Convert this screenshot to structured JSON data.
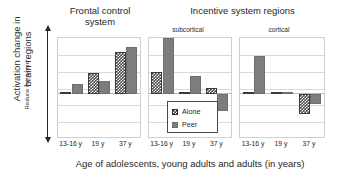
{
  "figure": {
    "y_axis_label_line1": "Activation change in",
    "y_axis_label_line2": "brain regions",
    "y_axis_direction_label": "Reduce increased",
    "x_axis_title": "Age of adolescents, young adults and adults (in years)"
  },
  "panels": [
    {
      "id": "frontal",
      "title": "Frontal control\nsystem",
      "subtitle": ""
    },
    {
      "id": "subcortical",
      "title": "Incentive system regions",
      "subtitle": "subcortical"
    },
    {
      "id": "cortical",
      "title": "",
      "subtitle": "cortical"
    }
  ],
  "legend": {
    "items": [
      {
        "label": "Alone",
        "swatch": "checkered-swatch",
        "color": "#3f3f3f"
      },
      {
        "label": "Peer",
        "swatch": "solid-gray-swatch",
        "color": "#7d7d7d"
      }
    ]
  },
  "ticks": [
    "13-16 y",
    "19 y",
    "37 y"
  ],
  "chart_data": {
    "type": "bar",
    "xlabel": "Age of adolescents, young adults and adults (in years)",
    "ylabel": "Activation change in brain regions",
    "ylim": [
      -1.8,
      2.4
    ],
    "grid": true,
    "legend_position": "inside-center",
    "annotations": [
      "Reduced ← → increased"
    ],
    "panels": [
      {
        "name": "Frontal control system",
        "subtitle": "",
        "categories": [
          "13-16 y",
          "19 y",
          "37 y"
        ],
        "series": [
          {
            "name": "Alone",
            "values": [
              0.08,
              0.85,
              1.75
            ]
          },
          {
            "name": "Peer",
            "values": [
              0.4,
              0.55,
              1.95
            ]
          }
        ]
      },
      {
        "name": "Incentive system regions",
        "subtitle": "subcortical",
        "categories": [
          "13-16 y",
          "19 y",
          "37 y"
        ],
        "series": [
          {
            "name": "Alone",
            "values": [
              0.9,
              0.03,
              0.22
            ]
          },
          {
            "name": "Peer",
            "values": [
              2.3,
              0.75,
              -0.7
            ]
          }
        ]
      },
      {
        "name": "Incentive system regions",
        "subtitle": "cortical",
        "categories": [
          "13-16 y",
          "19 y",
          "37 y"
        ],
        "series": [
          {
            "name": "Alone",
            "values": [
              0.06,
              0.07,
              -0.85
            ]
          },
          {
            "name": "Peer",
            "values": [
              1.55,
              0.05,
              -0.42
            ]
          }
        ]
      }
    ]
  }
}
